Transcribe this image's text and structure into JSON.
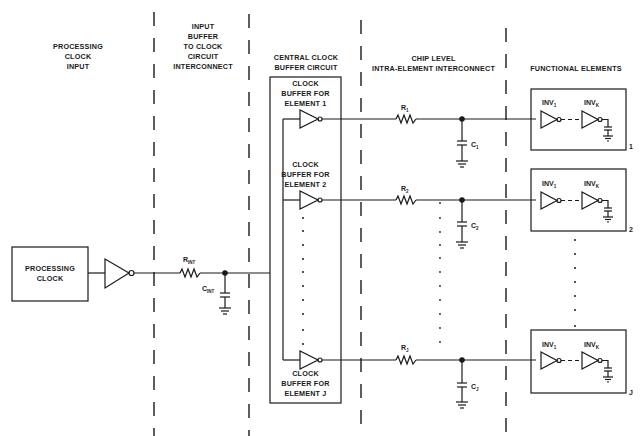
{
  "sections": {
    "processing_clock_input": "PROCESSING\nCLOCK\nINPUT",
    "input_buffer": "INPUT\nBUFFER\nTO CLOCK\nCIRCUIT\nINTERCONNECT",
    "central_clock": "CENTRAL CLOCK\nBUFFER CIRCUIT",
    "chip_level": "CHIP LEVEL\nINTRA-ELEMENT INTERCONNECT",
    "functional": "FUNCTIONAL ELEMENTS"
  },
  "source": {
    "label": "PROCESSING\nCLOCK"
  },
  "interconnect": {
    "r": "R",
    "r_sub": "INT",
    "c": "C",
    "c_sub": "INT"
  },
  "buffers": [
    {
      "label": "CLOCK\nBUFFER FOR\nELEMENT 1"
    },
    {
      "label": "CLOCK\nBUFFER FOR\nELEMENT 2"
    },
    {
      "label": "CLOCK\nBUFFER FOR\nELEMENT J"
    }
  ],
  "branches": [
    {
      "r": "R",
      "r_sub": "1",
      "c": "C",
      "c_sub": "1"
    },
    {
      "r": "R",
      "r_sub": "2",
      "c": "C",
      "c_sub": "2"
    },
    {
      "r": "R",
      "r_sub": "J",
      "c": "C",
      "c_sub": "J"
    }
  ],
  "elements": [
    {
      "inv_first": "INV",
      "inv_first_sub": "1",
      "inv_last": "INV",
      "inv_last_sub": "K",
      "index": "1"
    },
    {
      "inv_first": "INV",
      "inv_first_sub": "1",
      "inv_last": "INV",
      "inv_last_sub": "K",
      "index": "2"
    },
    {
      "inv_first": "INV",
      "inv_first_sub": "1",
      "inv_last": "INV",
      "inv_last_sub": "K",
      "index": "J"
    }
  ]
}
